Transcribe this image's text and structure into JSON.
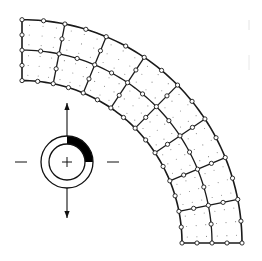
{
  "diagram": {
    "type": "finite-element-mesh",
    "mesh": {
      "center": [
        22,
        243
      ],
      "inner_radius": 160,
      "outer_radius": 220,
      "start_angle_deg": 90,
      "end_angle_deg": 0,
      "angular_elements": 8,
      "radial_elements": 2,
      "element_type": "8-node quadrilateral",
      "node_marker": "open-circle",
      "line_color": "#1a1a1a",
      "interior_dot_color": "#888888"
    },
    "inset_symbol": {
      "center": [
        67,
        162
      ],
      "outer_radius": 26,
      "inner_radius": 18,
      "filled_sector": {
        "from_deg": 0,
        "to_deg": 90,
        "color": "#000000",
        "note": "upper-right quadrant of ring filled"
      },
      "arrows": [
        {
          "direction": "up",
          "from": [
            67,
            136
          ],
          "to": [
            67,
            103
          ]
        },
        {
          "direction": "down",
          "from": [
            67,
            188
          ],
          "to": [
            67,
            218
          ]
        }
      ],
      "side_ticks": [
        {
          "side": "left",
          "x1": 15,
          "x2": 27,
          "y": 162
        },
        {
          "side": "right",
          "x1": 107,
          "x2": 119,
          "y": 162
        }
      ],
      "center_mark": "plus"
    }
  }
}
